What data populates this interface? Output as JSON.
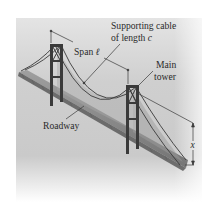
{
  "figure": {
    "labels": {
      "supporting_cable_line1": "Supporting cable",
      "supporting_cable_line2_prefix": "of length ",
      "supporting_cable_variable": "c",
      "span_prefix": "Span ",
      "span_variable": "ℓ",
      "main_tower_line1": "Main",
      "main_tower_line2": "tower",
      "roadway": "Roadway",
      "height_variable": "x"
    },
    "colors": {
      "panel_top": "#dcdcdc",
      "panel_mid": "#c6c6c6",
      "panel_bottom": "#ffffff",
      "structure": "#3a3a3a",
      "deck": "#8c8c8c",
      "text": "#2a2a2a"
    }
  }
}
